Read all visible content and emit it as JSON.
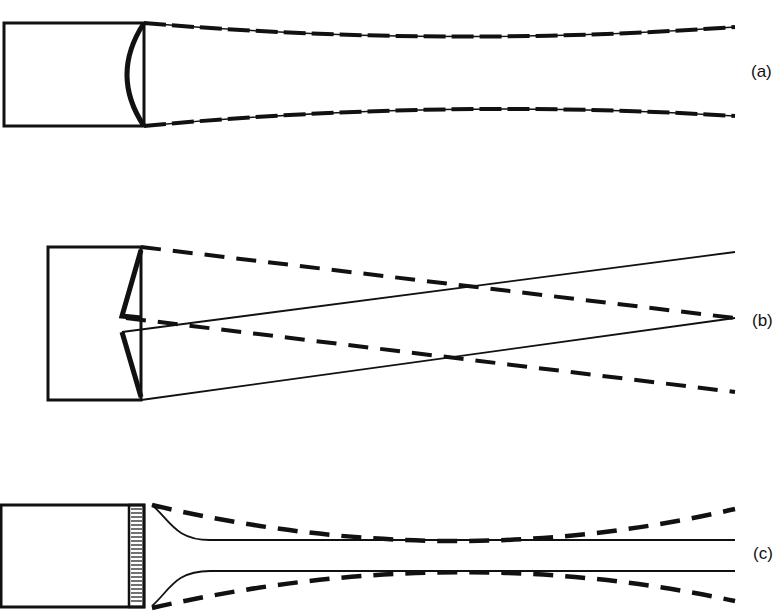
{
  "diagram": {
    "type": "optical beam diagram",
    "panels": [
      {
        "id": "a",
        "label": "(a)",
        "element": "curved lens at aperture of box",
        "beam": "slightly converging beam (dashed with solid envelope)"
      },
      {
        "id": "b",
        "label": "(b)",
        "element": "axicon / wedge reflector at aperture of box",
        "beam": "crossing dashed and solid rays converging to a point on the right"
      },
      {
        "id": "c",
        "label": "(c)",
        "element": "hatched grating / array at aperture of box",
        "beam": "solid collimated core with dashed waist envelope"
      }
    ],
    "colors": {
      "line": "#111111",
      "background": "#ffffff"
    }
  }
}
